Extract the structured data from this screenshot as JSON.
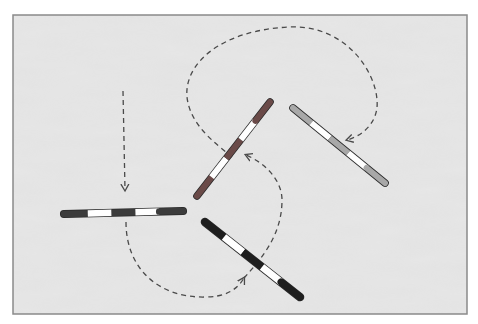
{
  "diagram": {
    "type": "course-diagram",
    "colors": {
      "arena_fill": "#e3e3e3",
      "arena_border": "#8a8a8a",
      "path_stroke": "#4a4a4a",
      "pole_dark": "#3c3c3c",
      "pole_red": "#6a4a48",
      "pole_grey": "#a8a8a8",
      "pole_white": "#ffffff",
      "pole_black": "#1e1e1e"
    },
    "poles": [
      {
        "id": "pole-horizontal-left",
        "stripes": [
          "dark",
          "white",
          "dark",
          "white",
          "dark"
        ],
        "orientation": "horizontal"
      },
      {
        "id": "pole-diagonal-center",
        "stripes": [
          "red",
          "white",
          "red",
          "white",
          "red"
        ],
        "orientation": "rising"
      },
      {
        "id": "pole-diagonal-right-grey",
        "stripes": [
          "grey",
          "white",
          "grey",
          "white",
          "grey"
        ],
        "orientation": "falling"
      },
      {
        "id": "pole-diagonal-bottom-black",
        "stripes": [
          "black",
          "white",
          "black",
          "white",
          "black"
        ],
        "orientation": "falling"
      }
    ],
    "path": {
      "style": "dashed",
      "arrows": 4,
      "segments": [
        "approach from top down to horizontal pole",
        "loop under horizontal pole curving right",
        "cross black pole and rise to center pole",
        "loop over top to grey pole"
      ]
    }
  }
}
